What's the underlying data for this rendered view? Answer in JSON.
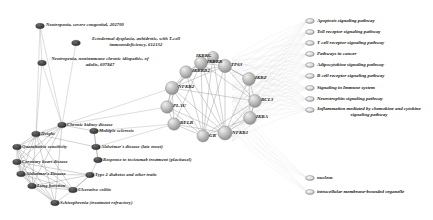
{
  "figure": {
    "type": "biological-network-graph"
  },
  "colors": {
    "disease_node": "#4a4a4a",
    "gene_node": "#b9b9b9",
    "gene_node_dark": "#8a8a8a",
    "term_node": "#d8d8d8",
    "edge": "#8c8c8c",
    "edge_faint": "#cfcfcf",
    "label": "#1a1a1a"
  },
  "disease_nodes_top": [
    {
      "id": "dt1",
      "label": "Neutropenia, severe congenital, 202700",
      "cx": 40,
      "cy": 26,
      "lx": 46,
      "ly": 22
    },
    {
      "id": "dt2",
      "label": "Ectodermal dysplasia, anhidrotic, with T-cell immunodeficiency, 612132",
      "cx": 76,
      "cy": 43,
      "lx": 82,
      "ly": 36
    },
    {
      "id": "dt3",
      "label": "Neutropenia, noninmmune chronic idiopathic, of adults, 607847",
      "cx": 42,
      "cy": 63,
      "lx": 48,
      "ly": 56
    }
  ],
  "disease_nodes_cluster": [
    {
      "id": "d1",
      "label": "Chronic kidney disease",
      "cx": 62,
      "cy": 125,
      "lx": 67,
      "ly": 122
    },
    {
      "id": "d2",
      "label": "Multiple sclerosis",
      "cx": 94,
      "cy": 131,
      "lx": 99,
      "ly": 128
    },
    {
      "id": "d3",
      "label": "Height",
      "cx": 36,
      "cy": 134,
      "lx": 41,
      "ly": 131
    },
    {
      "id": "d4",
      "label": "Quantitative sensitivity",
      "cx": 17,
      "cy": 147,
      "lx": 22,
      "ly": 144
    },
    {
      "id": "d5",
      "label": "Alzheimer's disease (late onset)",
      "cx": 96,
      "cy": 147,
      "lx": 101,
      "ly": 144
    },
    {
      "id": "d6",
      "label": "Coronary heart disease",
      "cx": 17,
      "cy": 162,
      "lx": 22,
      "ly": 159
    },
    {
      "id": "d7",
      "label": "Response to tocizumab treatment (placitaxel)",
      "cx": 98,
      "cy": 160,
      "lx": 103,
      "ly": 157
    },
    {
      "id": "d8",
      "label": "Alzheimer's Disease",
      "cx": 21,
      "cy": 174,
      "lx": 26,
      "ly": 171
    },
    {
      "id": "d9",
      "label": "Type 2 diabetes and other traits",
      "cx": 90,
      "cy": 175,
      "lx": 95,
      "ly": 172
    },
    {
      "id": "d10",
      "label": "Lung function",
      "cx": 32,
      "cy": 186,
      "lx": 37,
      "ly": 183
    },
    {
      "id": "d11",
      "label": "Ulcerative colitis",
      "cx": 73,
      "cy": 190,
      "lx": 78,
      "ly": 187
    },
    {
      "id": "d12",
      "label": "Schizophrenia (treatment refractory)",
      "cx": 55,
      "cy": 203,
      "lx": 60,
      "ly": 200
    }
  ],
  "gene_nodes": [
    {
      "id": "g1",
      "label": "IKBKB",
      "cx": 201,
      "cy": 63,
      "r": 6.4,
      "lx": 207,
      "ly": 59
    },
    {
      "id": "g2",
      "label": "TP63",
      "cx": 225,
      "cy": 66,
      "r": 6.6,
      "lx": 231,
      "ly": 62
    },
    {
      "id": "g3",
      "label": "IKBKB2",
      "cx": 186,
      "cy": 72,
      "r": 6.2,
      "lx": 192,
      "ly": 68
    },
    {
      "id": "g4",
      "label": "IKBZ",
      "cx": 249,
      "cy": 79,
      "r": 6.4,
      "lx": 255,
      "ly": 75
    },
    {
      "id": "g5",
      "label": "NFKB2",
      "cx": 172,
      "cy": 88,
      "r": 6.6,
      "lx": 178,
      "ly": 84
    },
    {
      "id": "g6",
      "label": "BCL3",
      "cx": 255,
      "cy": 101,
      "r": 6.4,
      "lx": 261,
      "ly": 97
    },
    {
      "id": "g7",
      "label": "PLAU",
      "cx": 167,
      "cy": 107,
      "r": 6.2,
      "lx": 173,
      "ly": 103
    },
    {
      "id": "g8",
      "label": "IKBA",
      "cx": 250,
      "cy": 118,
      "r": 6.4,
      "lx": 256,
      "ly": 114
    },
    {
      "id": "g9",
      "label": "RELB",
      "cx": 174,
      "cy": 124,
      "r": 6.2,
      "lx": 180,
      "ly": 120
    },
    {
      "id": "g10",
      "label": "GR",
      "cx": 203,
      "cy": 136,
      "r": 6.0,
      "lx": 209,
      "ly": 133
    },
    {
      "id": "g11",
      "label": "NFKB1",
      "cx": 225,
      "cy": 133,
      "r": 7.0,
      "lx": 232,
      "ly": 130
    },
    {
      "id": "g12",
      "label": "IKBKG",
      "cx": 213,
      "cy": 57,
      "r": 5.6,
      "lx": 196,
      "ly": 53
    }
  ],
  "pathway_terms": [
    {
      "id": "p1",
      "label": "Apoptosis signaling pathway",
      "cx": 310,
      "cy": 21,
      "lx": 317,
      "ly": 18
    },
    {
      "id": "p2",
      "label": "Toll receptor signaling pathway",
      "cx": 310,
      "cy": 32,
      "lx": 317,
      "ly": 29
    },
    {
      "id": "p3",
      "label": "T cell receptor signaling pathway",
      "cx": 310,
      "cy": 43,
      "lx": 317,
      "ly": 40
    },
    {
      "id": "p4",
      "label": "Pathways in cancer",
      "cx": 310,
      "cy": 54,
      "lx": 317,
      "ly": 51
    },
    {
      "id": "p5",
      "label": "Adipocytokine signaling pathway",
      "cx": 310,
      "cy": 65,
      "lx": 317,
      "ly": 62
    },
    {
      "id": "p6",
      "label": "B cell receptor signaling pathway",
      "cx": 310,
      "cy": 76,
      "lx": 317,
      "ly": 73
    },
    {
      "id": "p7",
      "label": "Signaling in Immune system",
      "cx": 310,
      "cy": 88,
      "lx": 317,
      "ly": 85
    },
    {
      "id": "p8",
      "label": "Neurotrophin signaling pathway",
      "cx": 310,
      "cy": 99,
      "lx": 317,
      "ly": 96
    },
    {
      "id": "p9",
      "label": "Inflammation mediated by chemokine and cytokine signaling pathway",
      "cx": 310,
      "cy": 110,
      "lx": 317,
      "ly": 106
    }
  ],
  "component_terms": [
    {
      "id": "c1",
      "label": "nucleus",
      "cx": 310,
      "cy": 178,
      "lx": 317,
      "ly": 175
    },
    {
      "id": "c2",
      "label": "intracellular membrane-bounded organelle",
      "cx": 310,
      "cy": 192,
      "lx": 317,
      "ly": 189
    }
  ],
  "gene_edges": [
    [
      "g1",
      "g2"
    ],
    [
      "g1",
      "g3"
    ],
    [
      "g1",
      "g5"
    ],
    [
      "g1",
      "g11"
    ],
    [
      "g1",
      "g10"
    ],
    [
      "g1",
      "g9"
    ],
    [
      "g1",
      "g12"
    ],
    [
      "g1",
      "g6"
    ],
    [
      "g2",
      "g4"
    ],
    [
      "g2",
      "g6"
    ],
    [
      "g2",
      "g11"
    ],
    [
      "g2",
      "g10"
    ],
    [
      "g2",
      "g12"
    ],
    [
      "g2",
      "g5"
    ],
    [
      "g3",
      "g5"
    ],
    [
      "g3",
      "g11"
    ],
    [
      "g3",
      "g10"
    ],
    [
      "g3",
      "g7"
    ],
    [
      "g3",
      "g12"
    ],
    [
      "g3",
      "g2"
    ],
    [
      "g4",
      "g6"
    ],
    [
      "g4",
      "g11"
    ],
    [
      "g4",
      "g2"
    ],
    [
      "g4",
      "g8"
    ],
    [
      "g5",
      "g7"
    ],
    [
      "g5",
      "g9"
    ],
    [
      "g5",
      "g11"
    ],
    [
      "g5",
      "g10"
    ],
    [
      "g5",
      "g6"
    ],
    [
      "g6",
      "g8"
    ],
    [
      "g6",
      "g11"
    ],
    [
      "g6",
      "g10"
    ],
    [
      "g7",
      "g9"
    ],
    [
      "g7",
      "g11"
    ],
    [
      "g7",
      "g10"
    ],
    [
      "g7",
      "g5"
    ],
    [
      "g8",
      "g11"
    ],
    [
      "g8",
      "g10"
    ],
    [
      "g8",
      "g6"
    ],
    [
      "g9",
      "g10"
    ],
    [
      "g9",
      "g11"
    ],
    [
      "g10",
      "g11"
    ],
    [
      "g12",
      "g11"
    ],
    [
      "g12",
      "g5"
    ],
    [
      "g12",
      "g10"
    ]
  ],
  "disease_edges": [
    [
      "d1",
      "d3"
    ],
    [
      "d1",
      "d2"
    ],
    [
      "d1",
      "d4"
    ],
    [
      "d1",
      "d6"
    ],
    [
      "d1",
      "d8"
    ],
    [
      "d1",
      "d12"
    ],
    [
      "d1",
      "d10"
    ],
    [
      "d3",
      "d4"
    ],
    [
      "d3",
      "d6"
    ],
    [
      "d3",
      "d8"
    ],
    [
      "d3",
      "d10"
    ],
    [
      "d3",
      "d12"
    ],
    [
      "d3",
      "d11"
    ],
    [
      "d3",
      "d5"
    ],
    [
      "d4",
      "d6"
    ],
    [
      "d4",
      "d8"
    ],
    [
      "d4",
      "d10"
    ],
    [
      "d4",
      "d12"
    ],
    [
      "d4",
      "d11"
    ],
    [
      "d6",
      "d8"
    ],
    [
      "d6",
      "d10"
    ],
    [
      "d6",
      "d12"
    ],
    [
      "d6",
      "d11"
    ],
    [
      "d6",
      "d9"
    ],
    [
      "d8",
      "d10"
    ],
    [
      "d8",
      "d12"
    ],
    [
      "d8",
      "d11"
    ],
    [
      "d8",
      "d9"
    ],
    [
      "d10",
      "d12"
    ],
    [
      "d10",
      "d11"
    ],
    [
      "d10",
      "d9"
    ],
    [
      "d12",
      "d11"
    ],
    [
      "d11",
      "d9"
    ],
    [
      "d2",
      "d5"
    ],
    [
      "d5",
      "d7"
    ],
    [
      "d7",
      "d9"
    ],
    [
      "d2",
      "d7"
    ],
    [
      "d9",
      "d11"
    ]
  ],
  "bridge_edges": [
    [
      "dt1",
      "dt3"
    ],
    [
      "dt1",
      "d1"
    ],
    [
      "dt3",
      "d1"
    ],
    [
      "dt3",
      "d3"
    ],
    [
      "dt2",
      "d1"
    ],
    [
      "dt1",
      "d3"
    ],
    [
      "d1",
      "g7"
    ],
    [
      "d2",
      "g9"
    ],
    [
      "d5",
      "g9"
    ],
    [
      "d1",
      "g5"
    ]
  ]
}
